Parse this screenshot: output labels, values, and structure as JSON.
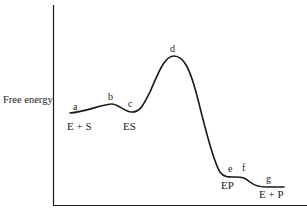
{
  "diagram": {
    "title": "",
    "y_axis_label": "Free energy",
    "x_axis_label": "",
    "point_labels": [
      {
        "id": "a",
        "text": "a",
        "x": 76,
        "y": 110
      },
      {
        "id": "b",
        "text": "b",
        "x": 112,
        "y": 100
      },
      {
        "id": "c",
        "text": "c",
        "x": 131,
        "y": 107
      },
      {
        "id": "d",
        "text": "d",
        "x": 174,
        "y": 51
      },
      {
        "id": "e",
        "text": "e",
        "x": 231,
        "y": 172
      },
      {
        "id": "f",
        "text": "f",
        "x": 244,
        "y": 171
      },
      {
        "id": "g",
        "text": "g",
        "x": 268,
        "y": 181
      }
    ],
    "state_labels": [
      {
        "id": "e-plus-s",
        "text": "E + S",
        "x": 76,
        "y": 129
      },
      {
        "id": "es",
        "text": "ES",
        "x": 129,
        "y": 129
      },
      {
        "id": "ep",
        "text": "EP",
        "x": 229,
        "y": 189
      },
      {
        "id": "e-plus-p",
        "text": "E + P",
        "x": 265,
        "y": 197
      }
    ],
    "colors": {
      "line": "#1a1a1a",
      "background": "#ffffff"
    }
  }
}
